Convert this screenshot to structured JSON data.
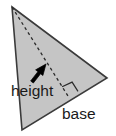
{
  "figure": {
    "kind": "geometry-diagram",
    "background_color": "#ffffff",
    "width": 116,
    "height": 136
  },
  "shape": {
    "name": "triangle",
    "fill_color": "#c5c5c5",
    "stroke_color": "#3b3b3b",
    "stroke_width": 1.6,
    "vertices": [
      {
        "name": "apex",
        "x": 12,
        "y": 7
      },
      {
        "name": "right",
        "x": 107,
        "y": 78
      },
      {
        "name": "bottom-left",
        "x": 22,
        "y": 130
      }
    ]
  },
  "altitude": {
    "name": "height-segment",
    "style": "dashed",
    "stroke_color": "#2a2a2a",
    "stroke_width": 1.3,
    "dash_pattern": "3 3",
    "from": {
      "x": 12,
      "y": 7
    },
    "to": {
      "x": 68,
      "y": 96
    }
  },
  "right_angle": {
    "name": "right-angle-marker",
    "stroke_color": "#2a2a2a",
    "stroke_width": 1.2,
    "size": 11,
    "corner": {
      "x": 68,
      "y": 96
    }
  },
  "pointer": {
    "name": "height-arrow",
    "fill_color": "#000000",
    "tail": {
      "x": 32,
      "y": 82
    },
    "tip": {
      "x": 46,
      "y": 64
    }
  },
  "labels": {
    "height": "height",
    "base": "base"
  }
}
